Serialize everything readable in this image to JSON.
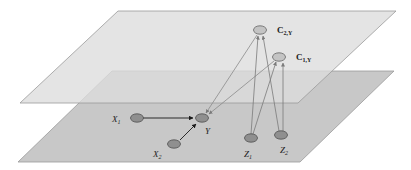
{
  "diagram": {
    "type": "two-layer graphical model",
    "colors": {
      "background": "#ffffff",
      "top_plane": "#d9d9d9",
      "bottom_plane": "#c8c8c8",
      "plane_edge": "#9a9a9a",
      "node_dark": "#8f8f8f",
      "node_light": "#c4c4c4",
      "edge_black": "#1a1a1a",
      "edge_gray": "#7a7a7a"
    },
    "planes": [
      {
        "id": "top",
        "label": ""
      },
      {
        "id": "bottom",
        "label": ""
      }
    ],
    "nodes": [
      {
        "id": "C2Y",
        "label_main": "C",
        "label_sub": "2,Y",
        "plane": "top"
      },
      {
        "id": "C1Y",
        "label_main": "C",
        "label_sub": "1,Y",
        "plane": "top"
      },
      {
        "id": "X1",
        "label_main": "X",
        "label_sub": "1",
        "plane": "bottom"
      },
      {
        "id": "Y",
        "label_main": "Y",
        "label_sub": "",
        "plane": "bottom"
      },
      {
        "id": "X2",
        "label_main": "X",
        "label_sub": "2",
        "plane": "bottom"
      },
      {
        "id": "Z1",
        "label_main": "Z",
        "label_sub": "1",
        "plane": "bottom"
      },
      {
        "id": "Z2",
        "label_main": "Z",
        "label_sub": "2",
        "plane": "bottom"
      }
    ],
    "edges": [
      {
        "from": "X1",
        "to": "Y",
        "style": "black"
      },
      {
        "from": "X2",
        "to": "Y",
        "style": "black"
      },
      {
        "from": "C2Y",
        "to": "Y",
        "style": "gray"
      },
      {
        "from": "C1Y",
        "to": "Y",
        "style": "gray"
      },
      {
        "from": "Z1",
        "to": "C2Y",
        "style": "gray"
      },
      {
        "from": "Z1",
        "to": "C1Y",
        "style": "gray"
      },
      {
        "from": "Z2",
        "to": "C2Y",
        "style": "gray"
      },
      {
        "from": "Z2",
        "to": "C1Y",
        "style": "gray"
      }
    ]
  }
}
